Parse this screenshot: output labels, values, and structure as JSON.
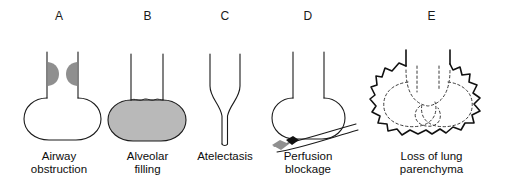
{
  "figure": {
    "background_color": "#ffffff",
    "line_color": "#1a1a1a",
    "fill_color": "#b9b9b9",
    "embolus_color": "#8f8f8f",
    "embolus_tip_color": "#111111"
  },
  "panels": [
    {
      "letter": "A",
      "caption_line1": "Airway",
      "caption_line2": "obstruction",
      "art_name": "alveolus-with-airway-obstruction",
      "elements": {
        "alveolus": "open round alveolus",
        "airway": "vertical neck",
        "obstruction_left": "gray half-disc plug on left airway wall",
        "obstruction_right": "gray half-disc plug on right airway wall"
      }
    },
    {
      "letter": "B",
      "caption_line1": "Alveolar",
      "caption_line2": "filling",
      "art_name": "alveolus-filled-with-fluid",
      "elements": {
        "alveolus": "round alveolus filled with gray fluid",
        "airway": "vertical neck",
        "fluid_level": "wavy meniscus at base of airway"
      }
    },
    {
      "letter": "C",
      "caption_line1": "Atelectasis",
      "caption_line2": "",
      "art_name": "collapsed-alveolus",
      "elements": {
        "airway": "vertical neck tapering inward",
        "collapsed_sac": "narrow collapsed tube"
      }
    },
    {
      "letter": "D",
      "caption_line1": "Perfusion",
      "caption_line2": "blockage",
      "art_name": "alveolus-with-blocked-vessel",
      "elements": {
        "alveolus": "open round alveolus",
        "airway": "vertical neck",
        "vessel": "curved capillary beneath alveolus",
        "embolus": "gray wedge with black tip occluding vessel"
      }
    },
    {
      "letter": "E",
      "caption_line1": "Loss of lung",
      "caption_line2": "parenchyma",
      "art_name": "emphysematous-airspace",
      "elements": {
        "outer_wall": "irregular jagged boundary of merged airspace",
        "destroyed_septa": "dashed interior outlines of lost alveolar walls",
        "airway_stub_left": "left airway stub",
        "airway_stub_right": "right airway stub"
      }
    }
  ]
}
